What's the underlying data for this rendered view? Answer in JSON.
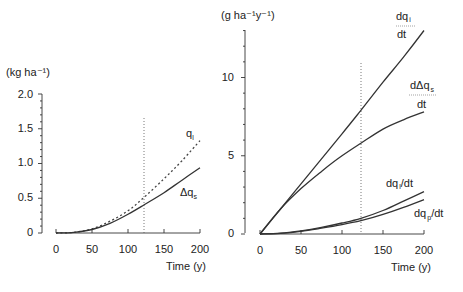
{
  "chart_data": [
    {
      "type": "line",
      "panel": "left",
      "title": "",
      "unit_label": "(kg ha⁻¹)",
      "xlabel": "Time (y)",
      "ylabel": "(kg ha-1)",
      "xlim": [
        0,
        200
      ],
      "ylim": [
        0,
        2.0
      ],
      "x_ticks": [
        "0",
        "50",
        "100",
        "150",
        "200"
      ],
      "y_ticks": [
        "0",
        "0.5",
        "1.0",
        "1.5",
        "2.0"
      ],
      "grid": false,
      "annotations": [
        {
          "type": "vertical_dotted_line",
          "x": 123
        }
      ],
      "x": [
        0,
        25,
        50,
        75,
        100,
        123,
        150,
        175,
        200
      ],
      "series": [
        {
          "name": "q_l",
          "label": "q",
          "subscript": "l",
          "style": "dotted",
          "values": [
            0.0,
            0.01,
            0.06,
            0.17,
            0.32,
            0.52,
            0.78,
            1.04,
            1.33
          ]
        },
        {
          "name": "Δq_s",
          "label": "Δq",
          "subscript": "s",
          "style": "solid",
          "values": [
            0.0,
            0.01,
            0.05,
            0.14,
            0.27,
            0.41,
            0.58,
            0.76,
            0.94
          ]
        }
      ]
    },
    {
      "type": "line",
      "panel": "right",
      "title": "",
      "unit_label": "(g ha⁻¹y⁻¹)",
      "xlabel": "Time (y)",
      "ylabel": "(g ha-1 y-1)",
      "xlim": [
        0,
        200
      ],
      "ylim": [
        0,
        13
      ],
      "x_ticks": [
        "0",
        "50",
        "100",
        "150",
        "200"
      ],
      "y_ticks": [
        "0",
        "5",
        "10"
      ],
      "grid": false,
      "annotations": [
        {
          "type": "vertical_dotted_line",
          "x": 123
        }
      ],
      "x": [
        0,
        25,
        50,
        75,
        100,
        123,
        150,
        175,
        200
      ],
      "series": [
        {
          "name": "dq_i/dt",
          "label_top": "dq",
          "subscript": "i",
          "label_bottom": "dt",
          "style": "solid",
          "values": [
            0.0,
            1.6,
            3.2,
            4.8,
            6.4,
            7.9,
            9.7,
            11.3,
            13.0
          ]
        },
        {
          "name": "dΔq_s/dt",
          "label_top": "dΔq",
          "subscript": "s",
          "label_bottom": "dt",
          "style": "solid",
          "values": [
            0.0,
            1.6,
            2.9,
            4.0,
            5.0,
            5.8,
            6.7,
            7.3,
            7.8
          ]
        },
        {
          "name": "dq_l/dt",
          "label": "dq",
          "subscript": "l",
          "suffix": "/dt",
          "style": "solid",
          "values": [
            0.0,
            0.05,
            0.2,
            0.42,
            0.7,
            1.0,
            1.5,
            2.1,
            2.7
          ]
        },
        {
          "name": "dq_p/dt",
          "label": "dq",
          "subscript": "p",
          "suffix": "/dt",
          "style": "solid",
          "values": [
            0.0,
            0.04,
            0.17,
            0.37,
            0.6,
            0.85,
            1.25,
            1.7,
            2.2
          ]
        }
      ]
    }
  ],
  "left": {
    "unit_label": "(kg ha⁻¹)",
    "xlabel": "Time (y)",
    "x_ticks": [
      "0",
      "50",
      "100",
      "150",
      "200"
    ],
    "y_ticks": [
      "0",
      "0.5",
      "1.0",
      "1.5",
      "2.0"
    ],
    "label_ql_main": "q",
    "label_ql_sub": "l",
    "label_dqs_main": "Δq",
    "label_dqs_sub": "s"
  },
  "right": {
    "unit_label": "(g ha⁻¹y⁻¹)",
    "xlabel": "Time (y)",
    "x_ticks": [
      "0",
      "50",
      "100",
      "150",
      "200"
    ],
    "y_ticks": [
      "0",
      "5",
      "10"
    ],
    "dqi_top": "dq",
    "dqi_sub": "i",
    "dqi_bottom": "dt",
    "ddqs_top": "dΔq",
    "ddqs_sub": "s",
    "ddqs_bottom": "dt",
    "dql_main": "dq",
    "dql_sub": "l",
    "dql_suffix": "/dt",
    "dqp_main": "dq",
    "dqp_sub": "p",
    "dqp_suffix": "/dt"
  }
}
